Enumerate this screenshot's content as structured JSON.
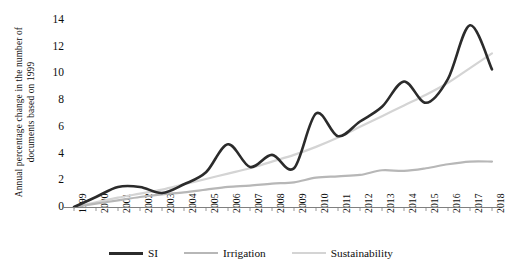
{
  "chart_data": {
    "type": "line",
    "title": "",
    "subtitle": "",
    "xlabel": "",
    "ylabel": "Annual percentage change in the number of documents based on 1999",
    "x": [
      1999,
      2000,
      2001,
      2002,
      2003,
      2004,
      2005,
      2006,
      2007,
      2008,
      2009,
      2010,
      2011,
      2012,
      2013,
      2014,
      2015,
      2016,
      2017,
      2018
    ],
    "xtick_labels": [
      "1999",
      "2000",
      "2001",
      "2002",
      "2003",
      "2004",
      "2005",
      "2006",
      "2007",
      "2008",
      "2009",
      "2010",
      "2011",
      "2012",
      "2013",
      "2014",
      "2015",
      "2016",
      "2017",
      "2018"
    ],
    "ytick_labels": [
      "0",
      "2",
      "4",
      "6",
      "8",
      "10",
      "12",
      "14"
    ],
    "yticks": [
      0,
      2,
      4,
      6,
      8,
      10,
      12,
      14
    ],
    "ylim": [
      0,
      14
    ],
    "xlim": [
      1999,
      2018
    ],
    "grid": false,
    "legend_position": "bottom",
    "series": [
      {
        "name": "SI",
        "color": "#2b2b2b",
        "width": 2.6,
        "values": [
          0.0,
          0.75,
          1.5,
          1.5,
          1.05,
          1.7,
          2.6,
          4.7,
          3.0,
          3.9,
          2.9,
          7.0,
          5.3,
          6.4,
          7.5,
          9.4,
          7.8,
          9.6,
          13.6,
          10.3
        ]
      },
      {
        "name": "Irrigation",
        "color": "#b7b7b7",
        "width": 2.2,
        "values": [
          0.0,
          0.25,
          0.5,
          0.75,
          0.95,
          1.1,
          1.3,
          1.5,
          1.6,
          1.75,
          1.85,
          2.2,
          2.3,
          2.4,
          2.75,
          2.7,
          2.9,
          3.2,
          3.4,
          3.4
        ]
      },
      {
        "name": "Sustainability",
        "color": "#d4d4d4",
        "width": 2.2,
        "values": [
          0.0,
          0.35,
          0.7,
          1.0,
          1.3,
          1.7,
          2.1,
          2.5,
          2.9,
          3.4,
          3.9,
          4.5,
          5.2,
          6.0,
          6.8,
          7.6,
          8.4,
          9.3,
          10.4,
          11.5
        ]
      }
    ]
  },
  "legend": {
    "items": [
      {
        "label": "SI",
        "color": "#2b2b2b",
        "width": 3.4
      },
      {
        "label": "Irrigation",
        "color": "#b7b7b7",
        "width": 2.4
      },
      {
        "label": "Sustainability",
        "color": "#d4d4d4",
        "width": 2.4
      }
    ]
  },
  "axes": {
    "y_title": "Annual percentage change in the number of documents based on 1999",
    "axis_color": "#7f7f7f"
  },
  "colors": {
    "si": "#2b2b2b",
    "irrigation": "#b7b7b7",
    "sustainability": "#d4d4d4",
    "axis": "#7f7f7f",
    "text": "#0d0d0d",
    "background": "#ffffff"
  }
}
